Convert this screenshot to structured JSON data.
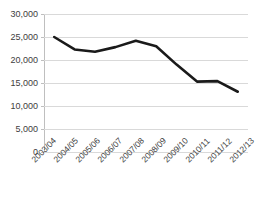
{
  "chart_data": {
    "type": "line",
    "title": "",
    "xlabel": "",
    "ylabel": "",
    "categories": [
      "2003/04",
      "2004/05",
      "2005/06",
      "2006/07",
      "2007/08",
      "2008/09",
      "2009/10",
      "2010/11",
      "2011/12",
      "2012/13"
    ],
    "values": [
      25000,
      22300,
      21800,
      22800,
      24200,
      23000,
      19000,
      15300,
      15400,
      13100
    ],
    "series": [
      {
        "name": "",
        "values": [
          25000,
          22300,
          21800,
          22800,
          24200,
          23000,
          19000,
          15300,
          15400,
          13100
        ]
      }
    ],
    "ylim": [
      0,
      30000
    ],
    "ytick_labels": [
      "30,000",
      "25,000",
      "20,000",
      "15,000",
      "10,000",
      "5,000",
      "0"
    ],
    "ytick_values": [
      30000,
      25000,
      20000,
      15000,
      10000,
      5000,
      0
    ],
    "grid": true,
    "legend": false,
    "legend_position": "none",
    "line_color": "#1a1a1a",
    "gridline_color": "#d9d9d9",
    "axis_color": "#bfbfbf",
    "text_color": "#404040"
  },
  "axis": {
    "y_labels": [
      "30,000",
      "25,000",
      "20,000",
      "15,000",
      "10,000",
      "5,000",
      "0"
    ],
    "x_labels": [
      "2003/04",
      "2004/05",
      "2005/06",
      "2006/07",
      "2007/08",
      "2008/09",
      "2009/10",
      "2010/11",
      "2011/12",
      "2012/13"
    ]
  },
  "header": {
    "title": ""
  }
}
